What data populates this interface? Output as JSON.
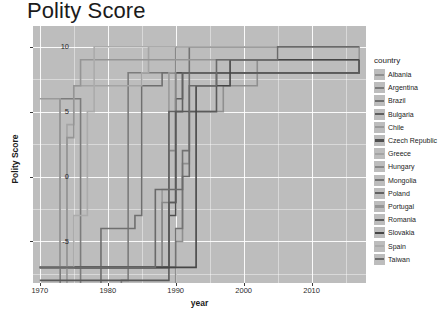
{
  "chart_data": {
    "type": "line",
    "title": "Polity Score",
    "xlabel": "year",
    "ylabel": "Polity Score",
    "xlim": [
      1969,
      2018
    ],
    "ylim": [
      -8.2,
      11.6
    ],
    "grid": true,
    "legend_position": "right",
    "legend_title": "country",
    "xticks": [
      1970,
      1980,
      1990,
      2000,
      2010
    ],
    "yticks": [
      -5,
      0,
      5,
      10
    ],
    "xtick_labels": [
      "1970",
      "1980",
      "1990",
      "2000",
      "2010"
    ],
    "ytick_labels": [
      "-5",
      "0",
      "5",
      "10"
    ],
    "panel_background": "#bdbdbd",
    "gridline_color": "#ffffff",
    "series": [
      {
        "name": "Albania",
        "color": "#8f8f8f",
        "x": [
          1970,
          1989,
          1990,
          1991,
          1992,
          1996,
          1997,
          2001,
          2002,
          2012,
          2013,
          2017
        ],
        "values": [
          -9,
          -9,
          -5,
          1,
          5,
          5,
          7,
          7,
          9,
          9,
          9,
          9
        ]
      },
      {
        "name": "Argentina",
        "color": "#7c7c7c",
        "x": [
          1970,
          1972,
          1973,
          1975,
          1976,
          1982,
          1983,
          2017
        ],
        "values": [
          -9,
          -9,
          6,
          6,
          -9,
          -8,
          8,
          8
        ]
      },
      {
        "name": "Brazil",
        "color": "#6f6f6f",
        "x": [
          1970,
          1978,
          1979,
          1984,
          1985,
          1987,
          1988,
          2017
        ],
        "values": [
          -9,
          -9,
          -4,
          -3,
          7,
          7,
          8,
          8
        ]
      },
      {
        "name": "Bulgaria",
        "color": "#5e5e5e",
        "x": [
          1970,
          1988,
          1989,
          1990,
          1991,
          2017
        ],
        "values": [
          -7,
          -7,
          -2,
          6,
          8,
          8
        ]
      },
      {
        "name": "Chile",
        "color": "#9a9a9a",
        "x": [
          1970,
          1972,
          1973,
          1987,
          1988,
          1989,
          2017
        ],
        "values": [
          6,
          6,
          -7,
          -7,
          -1,
          8,
          8
        ]
      },
      {
        "name": "Czech Republic",
        "color": "#4f4f4f",
        "x": [
          1970,
          1988,
          1989,
          1990,
          1992,
          1993,
          2017
        ],
        "values": [
          -7,
          -7,
          -3,
          8,
          8,
          8,
          9
        ]
      },
      {
        "name": "Greece",
        "color": "#a4a4a4",
        "x": [
          1970,
          1973,
          1974,
          1975,
          1985,
          1986,
          2017
        ],
        "values": [
          -7,
          -7,
          4,
          7,
          8,
          10,
          10
        ]
      },
      {
        "name": "Hungary",
        "color": "#888888",
        "x": [
          1970,
          1987,
          1988,
          1989,
          1990,
          2010,
          2011,
          2017
        ],
        "values": [
          -7,
          -7,
          -2,
          2,
          10,
          10,
          10,
          10
        ]
      },
      {
        "name": "Mongolia",
        "color": "#737373",
        "x": [
          1970,
          1989,
          1990,
          1991,
          1992,
          2017
        ],
        "values": [
          -7,
          -7,
          -4,
          2,
          10,
          10
        ]
      },
      {
        "name": "Poland",
        "color": "#626262",
        "x": [
          1970,
          1988,
          1989,
          1990,
          1991,
          2017
        ],
        "values": [
          -7,
          -7,
          5,
          5,
          8,
          9
        ]
      },
      {
        "name": "Portugal",
        "color": "#959595",
        "x": [
          1970,
          1973,
          1974,
          1975,
          1976,
          2017
        ],
        "values": [
          -9,
          -9,
          3,
          7,
          9,
          10
        ]
      },
      {
        "name": "Romania",
        "color": "#5a5a5a",
        "x": [
          1970,
          1988,
          1989,
          1990,
          1995,
          1996,
          2017
        ],
        "values": [
          -8,
          -8,
          -2,
          5,
          5,
          8,
          9
        ]
      },
      {
        "name": "Slovakia",
        "color": "#464646",
        "x": [
          1970,
          1992,
          1993,
          1994,
          1997,
          1998,
          2017
        ],
        "values": [
          -7,
          -7,
          7,
          7,
          7,
          9,
          9
        ]
      },
      {
        "name": "Spain",
        "color": "#ababab",
        "x": [
          1970,
          1974,
          1975,
          1977,
          1978,
          2017
        ],
        "values": [
          -7,
          -7,
          -3,
          5,
          10,
          10
        ]
      },
      {
        "name": "Taiwan",
        "color": "#6a6a6a",
        "x": [
          1970,
          1986,
          1987,
          1991,
          1992,
          1996,
          2004,
          2005,
          2017
        ],
        "values": [
          -7,
          -7,
          -1,
          0,
          7,
          9,
          9,
          10,
          10
        ]
      }
    ]
  }
}
